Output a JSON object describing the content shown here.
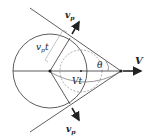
{
  "diagram": {
    "type": "mach-cone-geometry",
    "labels": {
      "velocity": "V",
      "distance_travelled": "Vt",
      "wave_radius": "v",
      "wave_radius_sub": "p",
      "wave_radius_t": "t",
      "angle": "θ",
      "upper_arrow": "v",
      "upper_arrow_sub": "p",
      "lower_arrow": "v",
      "lower_arrow_sub": "p"
    },
    "colors": {
      "line": "#333333",
      "dashed": "#888888",
      "background": "#ffffff"
    }
  }
}
